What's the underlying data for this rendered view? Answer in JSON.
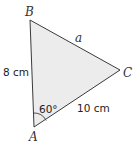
{
  "diagram": {
    "type": "triangle",
    "fill_color": "#ececec",
    "stroke_color": "#3a3a3a",
    "vertices": {
      "A": {
        "label": "A",
        "x": 34,
        "y": 127
      },
      "B": {
        "label": "B",
        "x": 30,
        "y": 20
      },
      "C": {
        "label": "C",
        "x": 120,
        "y": 70
      }
    },
    "sides": {
      "AB": {
        "label": "8 cm"
      },
      "BC": {
        "label": "a"
      },
      "AC": {
        "label": "10 cm"
      }
    },
    "angle_A": {
      "label": "60°"
    }
  }
}
